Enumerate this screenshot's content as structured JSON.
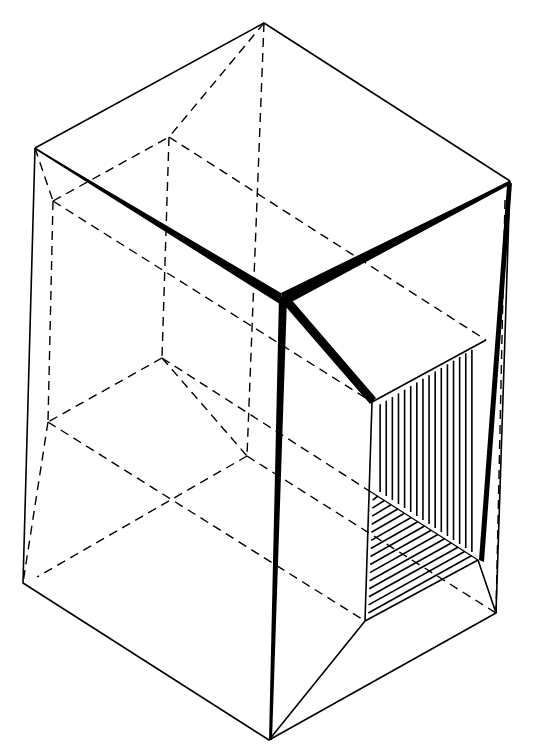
{
  "diagram": {
    "colors": {
      "ink": "#000000",
      "background": "#ffffff"
    },
    "vertices": {
      "top": [
        264,
        23
      ],
      "left_top": [
        35,
        148
      ],
      "right_top": [
        510,
        181
      ],
      "center": [
        281,
        298
      ],
      "left_bottom": [
        23,
        583
      ],
      "bottom": [
        269,
        740
      ],
      "right_bottom": [
        496,
        613
      ],
      "box_top_left": [
        372,
        402
      ],
      "box_top_right": [
        486,
        340
      ],
      "box_inner_bottom": [
        371,
        492
      ],
      "box_bottom_left": [
        365,
        621
      ],
      "box_bottom_right": [
        478,
        560
      ]
    },
    "hidden_vertices": {
      "h_left_top": [
        53,
        201
      ],
      "h_back_top": [
        169,
        137
      ],
      "h_back_mid": [
        162,
        358
      ],
      "h_left_low": [
        48,
        422
      ],
      "h_bottom_back": [
        247,
        456
      ],
      "h_bottom_left": [
        37,
        577
      ],
      "h_right": [
        505,
        200
      ]
    }
  }
}
